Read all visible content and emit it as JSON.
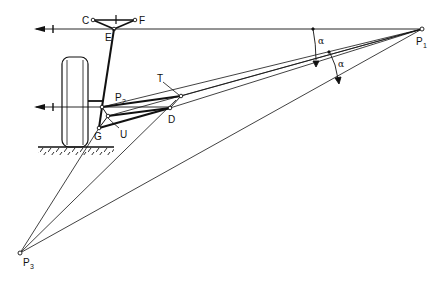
{
  "diagram": {
    "colors": {
      "line": "#111111",
      "background": "#ffffff"
    },
    "points": {
      "C": {
        "label": "C",
        "x": 93,
        "y": 20
      },
      "F": {
        "label": "F",
        "x": 135,
        "y": 20
      },
      "E": {
        "label": "E",
        "x": 114,
        "y": 29
      },
      "P1": {
        "label": "P",
        "sub": "1",
        "x": 422,
        "y": 29
      },
      "P2": {
        "label": "P",
        "sub": "2",
        "x": 102,
        "y": 107
      },
      "P3": {
        "label": "P",
        "sub": "3",
        "x": 20,
        "y": 253
      },
      "T": {
        "label": "T",
        "x": 181,
        "y": 96
      },
      "D": {
        "label": "D",
        "x": 170,
        "y": 108
      },
      "U": {
        "label": "U",
        "x": 108,
        "y": 116
      },
      "G": {
        "label": "G",
        "x": 99,
        "y": 128
      }
    },
    "angles": [
      {
        "label": "α",
        "position": "upper"
      },
      {
        "label": "α",
        "position": "lower"
      }
    ],
    "elements": [
      "wheel",
      "ground",
      "upper-axis-arrow",
      "lower-axis-arrow"
    ]
  }
}
